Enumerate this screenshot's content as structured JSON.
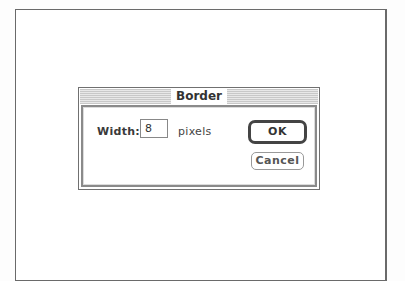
{
  "dialog": {
    "title": "Border",
    "width_label": "Width:",
    "width_value": "8",
    "unit_label": "pixels",
    "ok_label": "OK",
    "cancel_label": "Cancel"
  }
}
